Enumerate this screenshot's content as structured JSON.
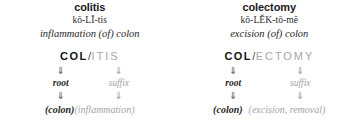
{
  "entries": [
    {
      "headword": "colitis",
      "pronunciation": "kō-LĪ-tis",
      "definition": "inflammation (of) colon",
      "term": {
        "root": "COL",
        "separator": "/",
        "suffix": "ITIS"
      },
      "arrow_glyph": "⇓",
      "parts": {
        "root_label": "root",
        "suffix_label": "suffix"
      },
      "meanings": {
        "root_meaning": "(colon)",
        "suffix_meaning": "(inflammation)"
      }
    },
    {
      "headword": "colectomy",
      "pronunciation": "kō-LĔK-tō-mē",
      "definition": "excision (of) colon",
      "term": {
        "root": "COL",
        "separator": "/",
        "suffix": "ECTOMY"
      },
      "arrow_glyph": "⇓",
      "parts": {
        "root_label": "root",
        "suffix_label": "suffix"
      },
      "meanings": {
        "root_meaning": "(colon)",
        "suffix_meaning": "(excision, removal)"
      }
    }
  ],
  "colors": {
    "text_primary": "#1a1a1a",
    "text_muted": "#a3a3a3",
    "arrow": "#555555",
    "arrow_muted": "#9c9c9c",
    "background": "#ffffff"
  }
}
